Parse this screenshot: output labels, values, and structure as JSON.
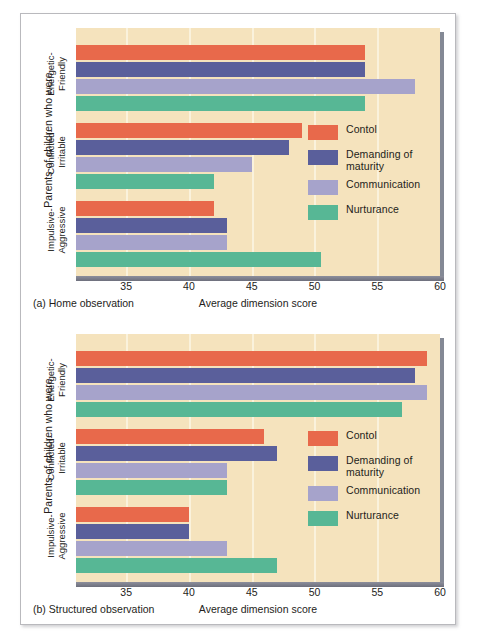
{
  "figure": {
    "axis_label_y": "Parents of children who were",
    "axis_label_x": "Average dimension score",
    "categories": [
      "Energetic-Friendly",
      "Conflicted-Irritable",
      "Impulsive-Aggressive"
    ],
    "category_lines": [
      [
        "Energetic-",
        "Friendly"
      ],
      [
        "Conflicted-",
        "Irritable"
      ],
      [
        "Impulsive-",
        "Aggressive"
      ]
    ],
    "tick_labels": [
      "35",
      "40",
      "45",
      "50",
      "55",
      "60"
    ],
    "legend": [
      {
        "label": "Contol",
        "color": "#e8694b"
      },
      {
        "label": "Demanding of maturity",
        "color": "#5a5f9b"
      },
      {
        "label": "Communication",
        "color": "#a6a3cb"
      },
      {
        "label": "Nurturance",
        "color": "#57b795"
      }
    ],
    "caption_a": "(a) Home observation",
    "caption_b": "(b) Structured observation",
    "plot_background": "#f5e3bd"
  },
  "chart_data": [
    {
      "type": "bar",
      "orientation": "horizontal",
      "title": "(a) Home observation",
      "xlabel": "Average dimension score",
      "ylabel": "Parents of children who were",
      "xlim": [
        31,
        60
      ],
      "xticks": [
        35,
        40,
        45,
        50,
        55,
        60
      ],
      "grid": true,
      "legend_position": "inside-right",
      "categories": [
        "Energetic-Friendly",
        "Conflicted-Irritable",
        "Impulsive-Aggressive"
      ],
      "series": [
        {
          "name": "Contol",
          "color": "#e8694b",
          "values": [
            54.0,
            49.0,
            42.0
          ]
        },
        {
          "name": "Demanding of maturity",
          "color": "#5a5f9b",
          "values": [
            54.0,
            48.0,
            43.0
          ]
        },
        {
          "name": "Communication",
          "color": "#a6a3cb",
          "values": [
            58.0,
            45.0,
            43.0
          ]
        },
        {
          "name": "Nurturance",
          "color": "#57b795",
          "values": [
            54.0,
            42.0,
            50.5
          ]
        }
      ]
    },
    {
      "type": "bar",
      "orientation": "horizontal",
      "title": "(b) Structured observation",
      "xlabel": "Average dimension score",
      "ylabel": "Parents of children who were",
      "xlim": [
        31,
        60
      ],
      "xticks": [
        35,
        40,
        45,
        50,
        55,
        60
      ],
      "grid": true,
      "legend_position": "inside-right",
      "categories": [
        "Energetic-Friendly",
        "Conflicted-Irritable",
        "Impulsive-Aggressive"
      ],
      "series": [
        {
          "name": "Contol",
          "color": "#e8694b",
          "values": [
            59.0,
            46.0,
            40.0
          ]
        },
        {
          "name": "Demanding of maturity",
          "color": "#5a5f9b",
          "values": [
            58.0,
            47.0,
            40.0
          ]
        },
        {
          "name": "Communication",
          "color": "#a6a3cb",
          "values": [
            59.0,
            43.0,
            43.0
          ]
        },
        {
          "name": "Nurturance",
          "color": "#57b795",
          "values": [
            57.0,
            43.0,
            47.0
          ]
        }
      ]
    }
  ]
}
